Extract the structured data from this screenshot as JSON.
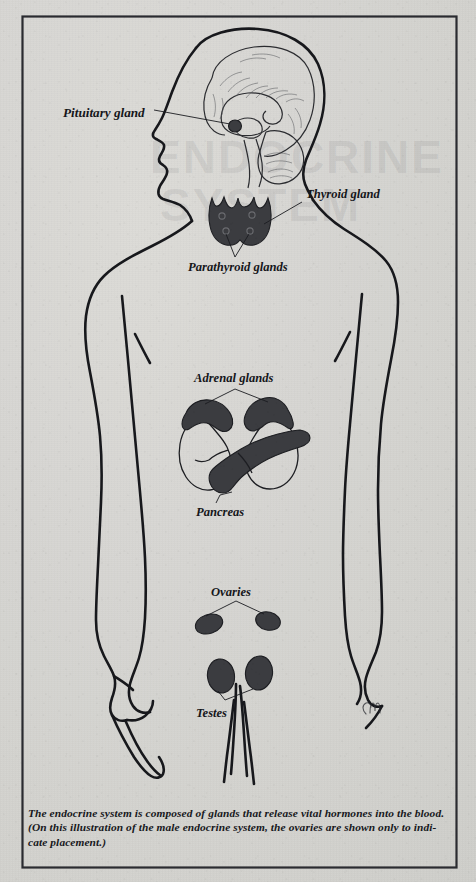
{
  "diagram": {
    "title": "The Endocrine System",
    "subject": "male endocrine system",
    "frame_color": "#2a2b30",
    "background_color": "#d6d5d1",
    "organ_fill_color": "#3b3c40",
    "line_color": "#17181c",
    "signature": "CM"
  },
  "labels": {
    "pituitary": "Pituitary gland",
    "thyroid": "Thyroid gland",
    "parathyroid": "Parathyroid glands",
    "adrenal": "Adrenal glands",
    "pancreas": "Pancreas",
    "ovaries": "Ovaries",
    "testes": "Testes"
  },
  "caption": {
    "line1": "The endocrine system is composed of glands that release vital hormones into the blood.",
    "line2": "(On this illustration of the male endocrine system, the ovaries are shown only to indi-",
    "line3": "cate placement.)"
  },
  "ghost_text": {
    "line1": "ENDOCRINE",
    "line2": "SYSTEM"
  },
  "glands": [
    {
      "name": "Pituitary gland",
      "location": "base of brain",
      "shaded": true
    },
    {
      "name": "Thyroid gland",
      "location": "neck",
      "shaded": true
    },
    {
      "name": "Parathyroid glands",
      "location": "behind thyroid",
      "shaded": true
    },
    {
      "name": "Adrenal glands",
      "location": "atop kidneys",
      "shaded": true
    },
    {
      "name": "Pancreas",
      "location": "upper abdomen",
      "shaded": true
    },
    {
      "name": "Ovaries",
      "location": "pelvis",
      "shaded": true
    },
    {
      "name": "Testes",
      "location": "scrotum",
      "shaded": true
    }
  ]
}
